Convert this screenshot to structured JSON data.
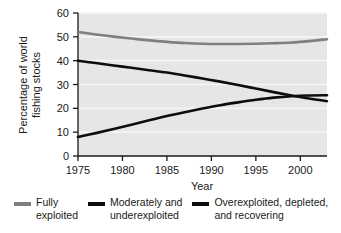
{
  "chart_data": {
    "type": "line",
    "title": "",
    "xlabel": "Year",
    "ylabel": "Percentage of world fishing stocks",
    "ylabel_line1": "Percentage of world",
    "ylabel_line2": "fishing stocks",
    "xlim": [
      1975,
      2003
    ],
    "ylim": [
      0,
      60
    ],
    "xticks": [
      1975,
      1980,
      1985,
      1990,
      1995,
      2000
    ],
    "xticklabels": [
      "1975",
      "1980",
      "1985",
      "1990",
      "1995",
      "2000"
    ],
    "yticks": [
      0,
      10,
      20,
      30,
      40,
      50,
      60
    ],
    "yticklabels": [
      "0",
      "10",
      "20",
      "30",
      "40",
      "50",
      "60"
    ],
    "grid": true,
    "grid_color": "#f5f5f5",
    "plot_background": "#e6e6e6",
    "legend_position": "below",
    "x": [
      1975,
      1977,
      1979,
      1981,
      1983,
      1985,
      1987,
      1989,
      1991,
      1993,
      1995,
      1997,
      1999,
      2001,
      2003
    ],
    "series": [
      {
        "name": "Fully exploited",
        "label_line1": "Fully",
        "label_line2": "exploited",
        "color": "#7f7f7f",
        "width": 2.6,
        "values": [
          52.0,
          51.0,
          50.1,
          49.3,
          48.5,
          47.9,
          47.4,
          47.1,
          47.0,
          47.0,
          47.1,
          47.3,
          47.6,
          48.2,
          49.0
        ]
      },
      {
        "name": "Moderately and underexploited",
        "label_line1": "Moderately and",
        "label_line2": "underexploited",
        "color": "#0d0d0d",
        "width": 2.6,
        "values": [
          40.0,
          39.0,
          38.0,
          37.0,
          36.0,
          35.0,
          33.8,
          32.5,
          31.2,
          29.8,
          28.3,
          26.8,
          25.4,
          24.1,
          23.0
        ]
      },
      {
        "name": "Overexploited, depleted, and recovering",
        "label_line1": "Overexploited, depleted,",
        "label_line2": "and recovering",
        "color": "#0d0d0d",
        "width": 2.6,
        "values": [
          8.0,
          9.6,
          11.3,
          13.1,
          15.0,
          16.8,
          18.4,
          19.9,
          21.3,
          22.5,
          23.6,
          24.5,
          25.1,
          25.4,
          25.5
        ]
      }
    ]
  },
  "axis": {
    "x_title": "Year",
    "y_title_line1": "Percentage of world",
    "y_title_line2": "fishing stocks"
  }
}
